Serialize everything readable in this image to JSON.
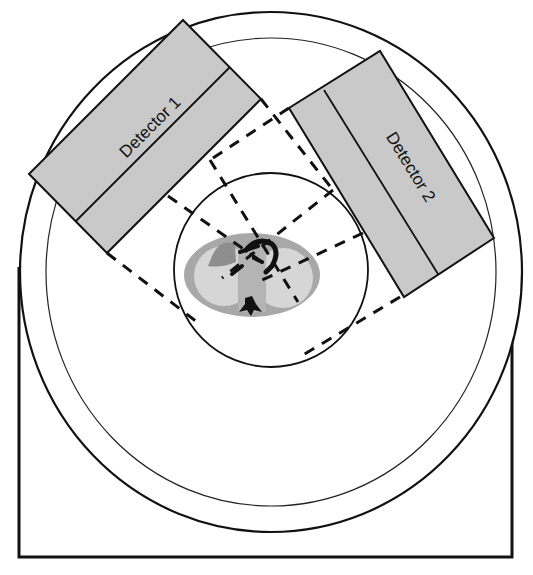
{
  "diagram": {
    "type": "dual-head SPECT gantry schematic",
    "detectors": [
      {
        "label": "Detector 1"
      },
      {
        "label": "Detector 2"
      }
    ],
    "colors": {
      "detector_fill": "#c9c9c9",
      "outline": "#111111",
      "torso_outer": "#a8a8a8",
      "lung": "#d6d6d6",
      "heart_region": "#8e8e8e",
      "mediastinum": "#b4b4b4",
      "vessels_spine": "#111111",
      "background": "#ffffff"
    }
  }
}
